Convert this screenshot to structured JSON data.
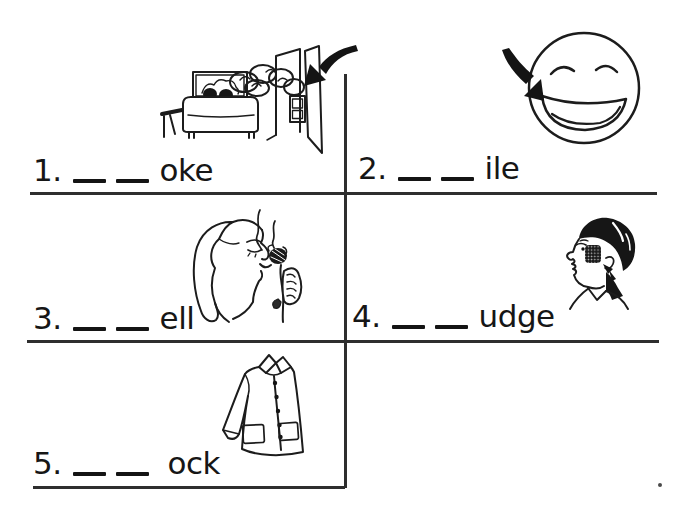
{
  "page": {
    "background_color": "#ffffff",
    "ink_color": "#141414",
    "type_label": "phonics fill-in-the-blank worksheet"
  },
  "exercises": [
    {
      "number": "1.",
      "blanks": 2,
      "suffix": "oke",
      "image": "smoke-billowing-through-open-door-into-living-room",
      "arrow": "bold-arrow-pointing-at-smoke"
    },
    {
      "number": "2.",
      "blanks": 2,
      "suffix": "ile",
      "image": "smiling-face",
      "arrow": "bold-arrow-pointing-at-smile"
    },
    {
      "number": "3.",
      "blanks": 2,
      "suffix": "ell",
      "image": "woman-smelling-flower",
      "arrow": ""
    },
    {
      "number": "4.",
      "blanks": 2,
      "suffix": "udge",
      "image": "man-with-smudge-on-cheek",
      "arrow": "small-arrow-pointing-at-smudge"
    },
    {
      "number": "5.",
      "blanks": 2,
      "suffix": "ock",
      "image": "smock-jacket",
      "arrow": ""
    }
  ]
}
